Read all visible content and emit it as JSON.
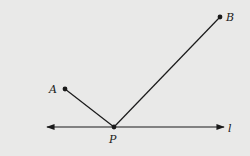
{
  "diagram": {
    "background": "#e9e9e8",
    "stroke_color": "#1a1a1a",
    "points": {
      "A": {
        "label": "A",
        "x": 65,
        "y": 89
      },
      "B": {
        "label": "B",
        "x": 220,
        "y": 17
      },
      "P": {
        "label": "P",
        "x": 114,
        "y": 127
      }
    },
    "segments": [
      {
        "from": "A",
        "to": "P"
      },
      {
        "from": "P",
        "to": "B"
      }
    ],
    "line": {
      "label": "l",
      "x1": 47,
      "x2": 224,
      "y": 127,
      "arrows": "both"
    }
  }
}
